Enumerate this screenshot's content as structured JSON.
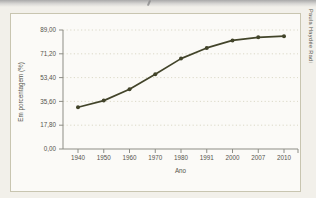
{
  "page": {
    "background_color": "#f2f0ea",
    "credit": "Paula Haydée Radi"
  },
  "chart_data": {
    "type": "line",
    "xlabel": "Ano",
    "ylabel": "Em porcentagem (%)",
    "categories": [
      "1940",
      "1950",
      "1960",
      "1970",
      "1980",
      "1991",
      "2000",
      "2007",
      "2010"
    ],
    "values": [
      31.2,
      36.2,
      44.7,
      55.9,
      67.6,
      75.6,
      81.2,
      83.5,
      84.4
    ],
    "ylim": [
      0,
      89
    ],
    "yticks": [
      0,
      17.8,
      35.6,
      53.4,
      71.2,
      89
    ],
    "ytick_labels": [
      "0,00",
      "17,80",
      "35,60",
      "53,40",
      "71,20",
      "89,00"
    ],
    "grid": "dotted horizontal",
    "legend": "none",
    "line_color": "#42442a",
    "marker_color": "#42442a",
    "grid_color": "#d3d0bd",
    "axis_color": "#8d8d85",
    "tick_label_color": "#55544c"
  }
}
